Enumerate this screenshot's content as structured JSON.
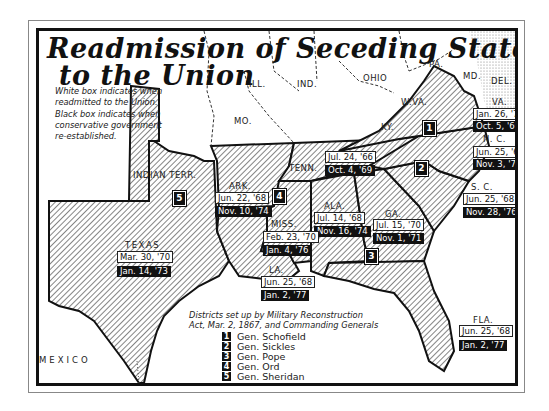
{
  "title": {
    "line1": "Readmission of Seceding States",
    "line2": "to the Union"
  },
  "notes": {
    "white_box": [
      "White box indicates when",
      "readmitted to the Union."
    ],
    "black_box": [
      "Black box indicates when",
      "conservative government",
      "re-established."
    ]
  },
  "non_seceding_labels": {
    "mo": "MO.",
    "ill": "ILL.",
    "ind": "IND.",
    "ohio": "OHIO",
    "pa": "PA.",
    "md": "MD.",
    "del": "DEL.",
    "wva": "W.VA.",
    "ky": "KY.",
    "indian_terr": "INDIAN TERR.",
    "mexico": "MEXICO"
  },
  "states": [
    {
      "key": "va",
      "name": "VA.",
      "readmitted": "Jan. 26, '70",
      "conservative": "Oct. 5, '69",
      "district": "1"
    },
    {
      "key": "nc",
      "name": "N. C.",
      "readmitted": "Jun. 25, '68",
      "conservative": "Nov. 3, '70",
      "district": "2"
    },
    {
      "key": "sc",
      "name": "S. C.",
      "readmitted": "Jun. 25, '68",
      "conservative": "Nov. 28, '76",
      "district": "2"
    },
    {
      "key": "tenn",
      "name": "TENN.",
      "readmitted": "Jul. 24, '66",
      "conservative": "Oct. 4, '69",
      "district": ""
    },
    {
      "key": "ga",
      "name": "GA.",
      "readmitted": "Jul. 15, '70",
      "conservative": "Nov. 1, '71",
      "district": "3"
    },
    {
      "key": "ala",
      "name": "ALA.",
      "readmitted": "Jul. 14, '68",
      "conservative": "Nov. 16, '74",
      "district": "3"
    },
    {
      "key": "fla",
      "name": "FLA.",
      "readmitted": "Jun. 25, '68",
      "conservative": "Jan. 2, '77",
      "district": "3"
    },
    {
      "key": "ark",
      "name": "ARK.",
      "readmitted": "Jun. 22, '68",
      "conservative": "Nov. 10, '74",
      "district": "4"
    },
    {
      "key": "miss",
      "name": "MISS.",
      "readmitted": "Feb. 23, '70",
      "conservative": "Jan. 4, '76",
      "district": "4"
    },
    {
      "key": "la",
      "name": "LA.",
      "readmitted": "Jun. 25, '68",
      "conservative": "Jan. 2, '77",
      "district": "5"
    },
    {
      "key": "texas",
      "name": "TEXAS",
      "readmitted": "Mar. 30, '70",
      "conservative": "Jan. 14, '73",
      "district": "5"
    }
  ],
  "district_markers": [
    "1",
    "2",
    "3",
    "4",
    "5"
  ],
  "legend": {
    "title": [
      "Districts set up by Military Reconstruction",
      "Act, Mar. 2, 1867, and Commanding Generals"
    ],
    "items": [
      {
        "num": "1",
        "general": "Gen. Schofield"
      },
      {
        "num": "2",
        "general": "Gen. Sickles"
      },
      {
        "num": "3",
        "general": "Gen. Pope"
      },
      {
        "num": "4",
        "general": "Gen. Ord"
      },
      {
        "num": "5",
        "general": "Gen. Sheridan"
      }
    ]
  },
  "colors": {
    "ink": "#111111",
    "paper": "#ffffff",
    "hatch": "#333333"
  }
}
